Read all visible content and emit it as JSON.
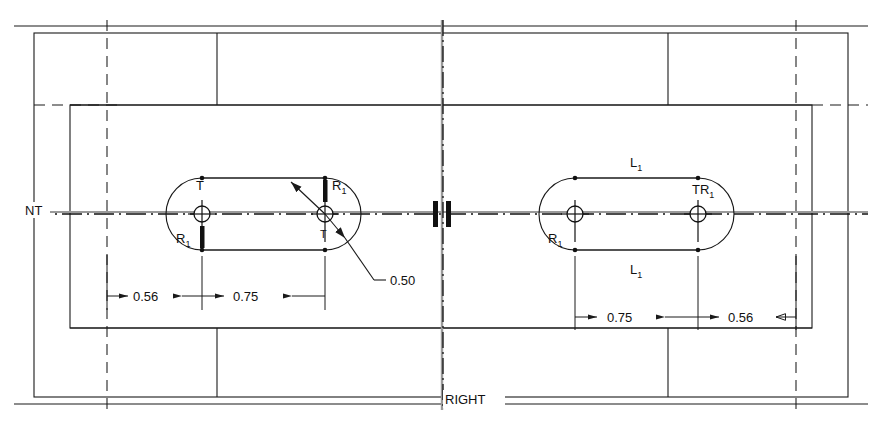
{
  "drawing": {
    "title": "Tennis court net post anchor layout",
    "background_color": "#ffffff",
    "line_color": "#1a1a1a"
  },
  "labels": {
    "net_line": "NT",
    "baseline_right": "RIGHT",
    "radius_note": "0.50",
    "tangent_left_top": "T",
    "tangent_left_bottom": "T",
    "radius_left_top": "R",
    "radius_left_bottom": "R",
    "radius_subscript": "1",
    "length_top": "L",
    "length_bottom": "L",
    "length_subscript": "1",
    "tangent_right": "T",
    "radius_right_label": "R",
    "radius_right_inner": "R"
  },
  "dimensions": {
    "left": [
      {
        "value": "0.56",
        "name": "left-outer-dimension"
      },
      {
        "value": "0.75",
        "name": "left-inner-dimension"
      }
    ],
    "right": [
      {
        "value": "0.75",
        "name": "right-inner-dimension"
      },
      {
        "value": "0.56",
        "name": "right-outer-dimension"
      }
    ]
  },
  "callouts": {
    "radius_leader": "0.50"
  }
}
